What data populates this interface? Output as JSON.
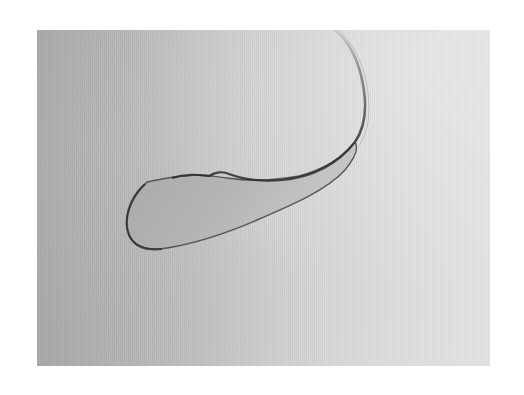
{
  "image": {
    "description": "Grayscale photograph of a teardrop-shaped liquid drop with a long thin curved tail",
    "colors": {
      "background_dark": "#a9a9a9",
      "background_light": "#e4e4e4",
      "drop_fill": "#b4b4b4",
      "drop_edge": "#3a3a3a",
      "page_border": "#ffffff"
    }
  }
}
